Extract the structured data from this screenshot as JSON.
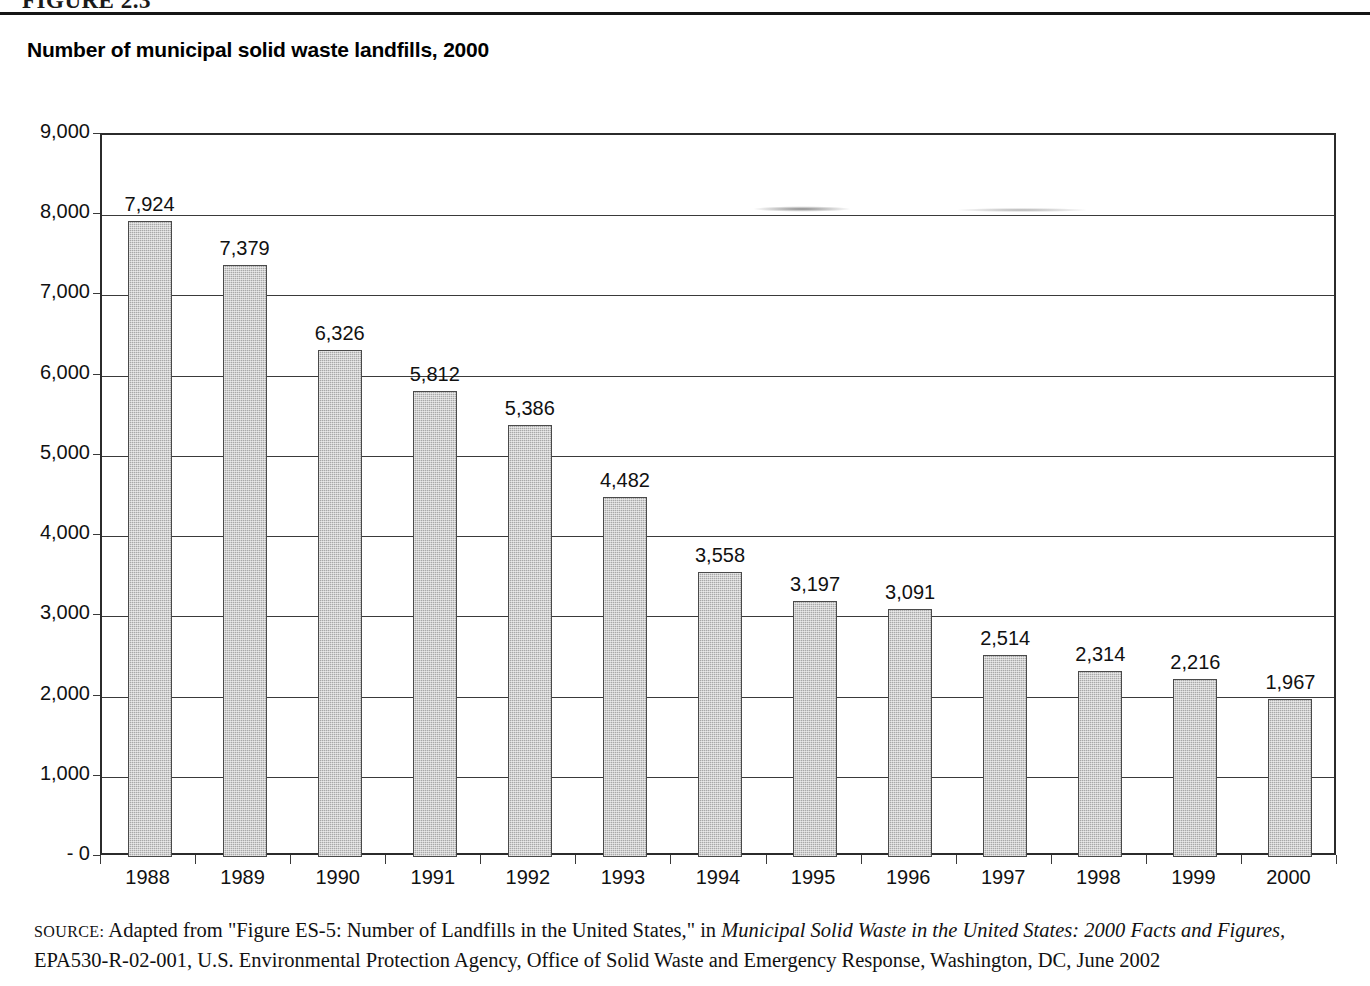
{
  "figure": {
    "number_label": "FIGURE 2.3",
    "title": "Number of municipal solid waste landfills, 2000"
  },
  "chart_data": {
    "type": "bar",
    "title": "Number of municipal solid waste landfills, 2000",
    "xlabel": "",
    "ylabel": "",
    "ylim": [
      0,
      9000
    ],
    "grid": true,
    "legend": "none",
    "y_ticks": [
      "- 0",
      "1,000",
      "2,000",
      "3,000",
      "4,000",
      "5,000",
      "6,000",
      "7,000",
      "8,000",
      "9,000"
    ],
    "categories": [
      "1988",
      "1989",
      "1990",
      "1991",
      "1992",
      "1993",
      "1994",
      "1995",
      "1996",
      "1997",
      "1998",
      "1999",
      "2000"
    ],
    "values": [
      7924,
      7379,
      6326,
      5812,
      5386,
      4482,
      3558,
      3197,
      3091,
      2514,
      2314,
      2216,
      1967
    ],
    "value_labels": [
      "7,924",
      "7,379",
      "6,326",
      "5,812",
      "5,386",
      "4,482",
      "3,558",
      "3,197",
      "3,091",
      "2,514",
      "2,314",
      "2,216",
      "1,967"
    ],
    "bar_color": "#a8a8a8",
    "bar_border_color": "#4a4a4a"
  },
  "source": {
    "label": "SOURCE:",
    "text_before": " Adapted from \"Figure ES-5: Number of Landfills in the United States,\" in ",
    "italic_title": "Municipal Solid Waste in the United States: 2000 Facts and Figures,",
    "text_after": " EPA530-R-02-001, U.S. Environmental Protection Agency, Office of Solid Waste and Emergency Response, Washington, DC, June 2002"
  }
}
